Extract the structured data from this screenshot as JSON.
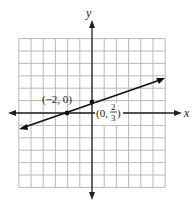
{
  "figure": {
    "type": "coordinate-plane-line-graph",
    "axes": {
      "x_label": "x",
      "y_label": "y",
      "x_range": [
        -6,
        6
      ],
      "y_range": [
        -6,
        6
      ],
      "grid": true,
      "grid_step": 1
    },
    "line": {
      "equation": "y = (1/3)x + 2/3",
      "through": [
        [
          -2,
          0
        ],
        [
          0,
          0.6667
        ]
      ],
      "arrows": "both"
    },
    "points": [
      {
        "label": "(−2, 0)",
        "x": -2,
        "y": 0
      },
      {
        "label_prefix": "(0, ",
        "frac_num": "2",
        "frac_den": "3",
        "label_suffix": ")",
        "x": 0,
        "y": 0.6667
      }
    ]
  }
}
